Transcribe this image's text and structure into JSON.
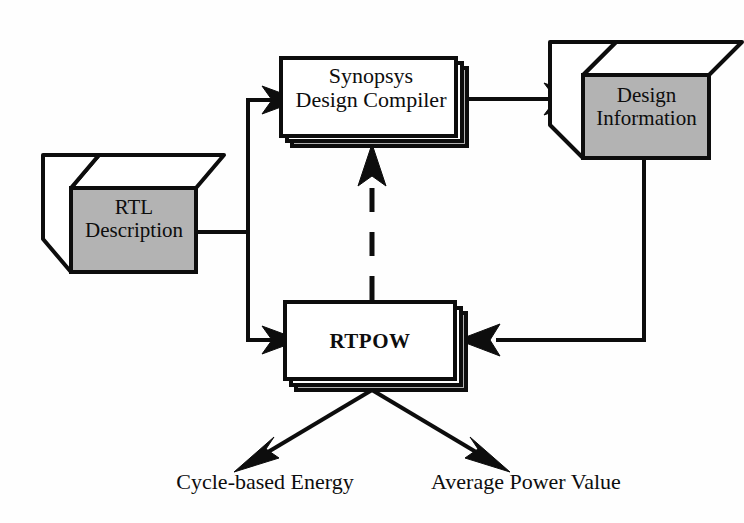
{
  "diagram": {
    "colors": {
      "background": "#fefefe",
      "stroke": "#0d0d0d",
      "cube_face_fill": "#b3b3b3",
      "cube_top_fill": "#ffffff",
      "box_fill": "#ffffff",
      "box_shadow_fill": "#b3b3b3"
    },
    "nodes": [
      {
        "id": "rtl-description",
        "shape": "cube",
        "line1": "RTL",
        "line2": "Description",
        "text": "RTL Description"
      },
      {
        "id": "synopsys-design-compiler",
        "shape": "stacked-box",
        "line1": "Synopsys",
        "line2": "Design Compiler",
        "text": "Synopsys Design Compiler"
      },
      {
        "id": "design-information",
        "shape": "cube",
        "line1": "Design",
        "line2": "Information",
        "text": "Design Information"
      },
      {
        "id": "rtpow",
        "shape": "stacked-box",
        "line1": "RTPOW",
        "line2": "",
        "text": "RTPOW"
      }
    ],
    "outputs": [
      {
        "id": "cycle-based-energy",
        "label": "Cycle-based Energy"
      },
      {
        "id": "average-power-value",
        "label": "Average Power Value"
      }
    ],
    "edges": [
      {
        "id": "rtl-to-synopsys",
        "from": "rtl-description",
        "to": "synopsys-design-compiler",
        "style": "solid",
        "arrow": "end"
      },
      {
        "id": "rtl-to-rtpow",
        "from": "rtl-description",
        "to": "rtpow",
        "style": "solid",
        "arrow": "end"
      },
      {
        "id": "synopsys-to-design-information",
        "from": "synopsys-design-compiler",
        "to": "design-information",
        "style": "solid",
        "arrow": "end"
      },
      {
        "id": "design-information-to-rtpow",
        "from": "design-information",
        "to": "rtpow",
        "style": "solid",
        "arrow": "end"
      },
      {
        "id": "rtpow-to-synopsys",
        "from": "rtpow",
        "to": "synopsys-design-compiler",
        "style": "dashed",
        "arrow": "end"
      },
      {
        "id": "rtpow-to-cycle-based-energy",
        "from": "rtpow",
        "to": "cycle-based-energy",
        "style": "solid",
        "arrow": "end"
      },
      {
        "id": "rtpow-to-average-power-value",
        "from": "rtpow",
        "to": "average-power-value",
        "style": "solid",
        "arrow": "end"
      }
    ]
  }
}
